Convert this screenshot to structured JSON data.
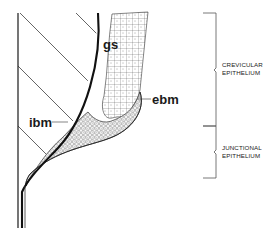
{
  "diagram": {
    "labels": {
      "gs": "gs",
      "ibm": "ibm",
      "ebm": "ebm"
    },
    "regions": [
      {
        "name": "crevicular",
        "line1": "CREVICULAR",
        "line2": "EPITHELIUM"
      },
      {
        "name": "junctional",
        "line1": "JUNCTIONAL",
        "line2": "EPITHELIUM"
      }
    ],
    "colors": {
      "ink": "#1a1a1a",
      "background": "#ffffff",
      "bracket": "#555555"
    }
  }
}
